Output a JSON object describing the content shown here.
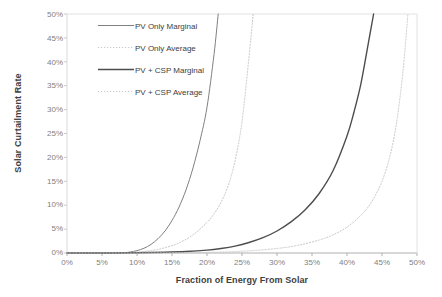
{
  "chart_data": {
    "type": "line",
    "title": "",
    "xlabel": "Fraction of Energy From Solar",
    "ylabel": "Solar Curtailment Rate",
    "xlim": [
      0,
      50
    ],
    "ylim": [
      0,
      50
    ],
    "x_tick_labels": [
      "0%",
      "5%",
      "10%",
      "15%",
      "20%",
      "25%",
      "30%",
      "35%",
      "40%",
      "45%",
      "50%"
    ],
    "y_tick_labels": [
      "0%",
      "5%",
      "10%",
      "15%",
      "20%",
      "25%",
      "30%",
      "35%",
      "40%",
      "45%",
      "50%"
    ],
    "x_ticks": [
      0,
      5,
      10,
      15,
      20,
      25,
      30,
      35,
      40,
      45,
      50
    ],
    "y_ticks": [
      0,
      5,
      10,
      15,
      20,
      25,
      30,
      35,
      40,
      45,
      50
    ],
    "grid": false,
    "legend_position": "upper-left-inside",
    "series": [
      {
        "name": "PV Only Marginal",
        "style": "solid",
        "color": "#808080",
        "width": 1.0,
        "x": [
          0,
          2,
          4,
          6,
          8,
          9,
          10,
          11,
          12,
          13,
          14,
          15,
          16,
          17,
          18,
          19,
          20,
          21,
          21.6
        ],
        "values": [
          0,
          0,
          0,
          0,
          0.05,
          0.2,
          0.5,
          1.0,
          1.8,
          3.0,
          4.6,
          6.8,
          9.6,
          13.2,
          17.8,
          23.5,
          30.5,
          41.5,
          50.0
        ]
      },
      {
        "name": "PV Only Average",
        "style": "dotted",
        "color": "#c8c8c8",
        "width": 1.0,
        "x": [
          0,
          4,
          8,
          10,
          12,
          14,
          16,
          18,
          20,
          21,
          22,
          23,
          24,
          25,
          26,
          26.6
        ],
        "values": [
          0,
          0,
          0.05,
          0.2,
          0.5,
          1.1,
          2.1,
          3.8,
          6.4,
          8.2,
          10.6,
          14.0,
          19.2,
          27.5,
          41.0,
          50.0
        ]
      },
      {
        "name": "PV + CSP Marginal",
        "style": "solid",
        "color": "#4d4d4d",
        "width": 1.4,
        "x": [
          0,
          5,
          10,
          14,
          17,
          20,
          22,
          24,
          26,
          28,
          30,
          32,
          34,
          36,
          38,
          40,
          41,
          42,
          43,
          43.8
        ],
        "values": [
          0,
          0,
          0.05,
          0.15,
          0.3,
          0.6,
          0.95,
          1.45,
          2.2,
          3.2,
          4.6,
          6.5,
          9.0,
          12.4,
          17.2,
          24.5,
          29.5,
          35.5,
          43.5,
          50.0
        ]
      },
      {
        "name": "PV + CSP  Average",
        "style": "dotted",
        "color": "#c8c8c8",
        "width": 1.0,
        "x": [
          0,
          10,
          18,
          22,
          26,
          30,
          33,
          36,
          38,
          40,
          42,
          43,
          44,
          45,
          46,
          47,
          48,
          48.7
        ],
        "values": [
          0,
          0,
          0.08,
          0.2,
          0.45,
          0.95,
          1.6,
          2.7,
          3.8,
          5.4,
          7.9,
          9.6,
          11.9,
          15.0,
          19.5,
          26.5,
          38.0,
          50.0
        ]
      }
    ]
  },
  "legend": {
    "items": [
      {
        "label": "PV Only Marginal"
      },
      {
        "label": "PV Only Average"
      },
      {
        "label": "PV + CSP Marginal"
      },
      {
        "label": "PV + CSP  Average"
      }
    ]
  }
}
